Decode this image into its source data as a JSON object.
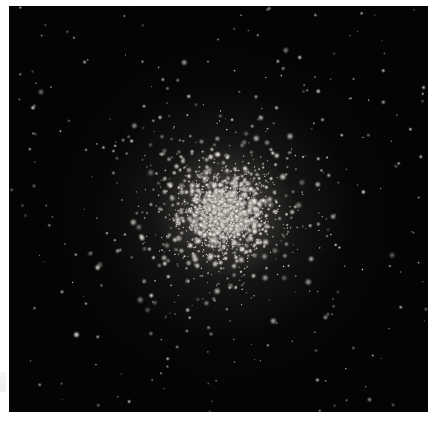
{
  "image": {
    "subject": "globular star cluster",
    "description": "Dense spherical cluster of stars on a black sky background, brightest and most concentrated at the core",
    "colors": {
      "background": "#040404",
      "page": "#ffffff",
      "star": "#e6e2dc",
      "core_glow": "#f4f1ec"
    },
    "star_count_estimate": 2200
  }
}
